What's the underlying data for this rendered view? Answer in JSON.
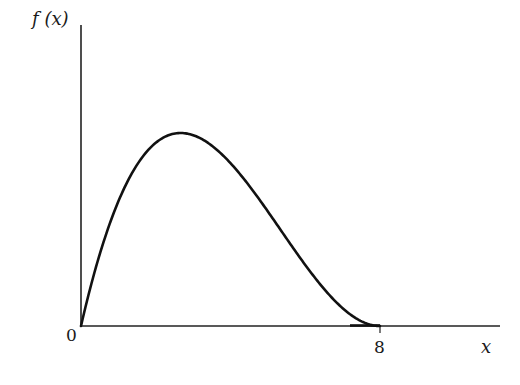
{
  "chart_data": {
    "type": "line",
    "title": "",
    "xlabel": "x",
    "ylabel": "f (x)",
    "x_ticks": [
      {
        "value": 8,
        "label": "8"
      }
    ],
    "origin_label": "0",
    "xlim": [
      0,
      12
    ],
    "ylim": [
      0,
      1.56
    ],
    "grid": false,
    "legend": null,
    "series": [
      {
        "name": "f(x)",
        "x": [
          0,
          0.5,
          1,
          1.5,
          2,
          2.5,
          2.67,
          3,
          3.5,
          4,
          4.5,
          5,
          5.5,
          6,
          6.5,
          7,
          7.5,
          8
        ],
        "y": [
          0,
          0.316,
          0.551,
          0.712,
          0.81,
          0.854,
          0.857,
          0.844,
          0.8,
          0.72,
          0.617,
          0.506,
          0.387,
          0.27,
          0.165,
          0.079,
          0.021,
          0
        ]
      }
    ],
    "annotations": [
      "curve is zero for x >= 8"
    ]
  },
  "axes": {
    "y_label": "f (x)",
    "x_label": "x",
    "origin": "0",
    "tick_8": "8"
  },
  "style": {
    "line_color": "#111111",
    "axis_color": "#222222"
  }
}
